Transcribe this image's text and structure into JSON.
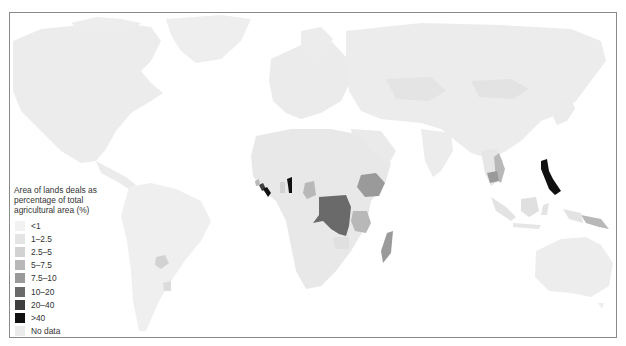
{
  "map": {
    "title": "Area of lands deals as percentage of total agricultural area (%)",
    "ocean_color": "#ffffff",
    "land_default_color": "#e9e9e9",
    "border_color": "#8a8a8a"
  },
  "legend": {
    "title_lines": [
      "Area of lands deals as",
      "percentage of total",
      "agricultural area (%)"
    ],
    "items": [
      {
        "label": "<1",
        "color": "#f2f2f2"
      },
      {
        "label": "1–2.5",
        "color": "#e4e4e4"
      },
      {
        "label": "2.5–5",
        "color": "#d2d2d2"
      },
      {
        "label": "5–7.5",
        "color": "#b8b8b8"
      },
      {
        "label": "7.5–10",
        "color": "#9a9a9a"
      },
      {
        "label": "10–20",
        "color": "#6a6a6a"
      },
      {
        "label": "20–40",
        "color": "#3e3e3e"
      },
      {
        "label": ">40",
        "color": "#111111"
      },
      {
        "label": "No data",
        "color": "#ebebeb"
      }
    ]
  },
  "highlighted_regions": [
    {
      "name": "Democratic Republic of the Congo",
      "class": "10–20"
    },
    {
      "name": "Liberia",
      "class": ">40"
    },
    {
      "name": "Sierra Leone",
      "class": "20–40"
    },
    {
      "name": "Benin",
      "class": ">40"
    },
    {
      "name": "Ethiopia",
      "class": "7.5–10"
    },
    {
      "name": "Tanzania",
      "class": "5–7.5"
    },
    {
      "name": "Madagascar",
      "class": "7.5–10"
    },
    {
      "name": "Cameroon",
      "class": "5–7.5"
    },
    {
      "name": "Philippines",
      "class": ">40"
    },
    {
      "name": "Vietnam",
      "class": "5–7.5"
    },
    {
      "name": "Cambodia",
      "class": "7.5–10"
    },
    {
      "name": "Papua New Guinea",
      "class": "5–7.5"
    },
    {
      "name": "Paraguay",
      "class": "2.5–5"
    }
  ]
}
